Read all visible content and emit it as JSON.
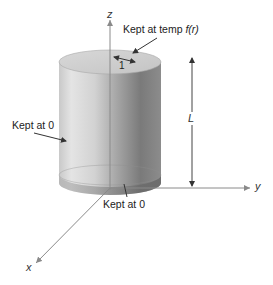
{
  "figure": {
    "type": "cylinder heat-conduction boundary conditions",
    "axes": {
      "z": "z",
      "y": "y",
      "x": "x"
    },
    "dimensions": {
      "height_label": "L",
      "radius_label": "1"
    },
    "annotations": {
      "top": "Kept at temp ",
      "top_func": "f(r)",
      "side": "Kept at 0",
      "bottom": "Kept at 0"
    },
    "colors": {
      "cylinder_light": "#e6e6e6",
      "cylinder_mid": "#b8b8b8",
      "cylinder_dark": "#6e6e6e",
      "axis": "#8a8a8a",
      "arrow": "#333333"
    }
  }
}
